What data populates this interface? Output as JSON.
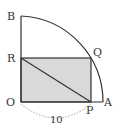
{
  "diagram": {
    "type": "geometry-quarter-circle-inscribed-rectangle",
    "colors": {
      "stroke": "#333333",
      "fill": "#d9d9d9",
      "dashed": "#999999"
    },
    "points": {
      "O": {
        "label": "O",
        "x": 21,
        "y": 102
      },
      "A": {
        "label": "A",
        "x": 103,
        "y": 102
      },
      "B": {
        "label": "B",
        "x": 21,
        "y": 16
      },
      "P": {
        "label": "P",
        "x": 91,
        "y": 102
      },
      "Q": {
        "label": "Q",
        "x": 91,
        "y": 58
      },
      "R": {
        "label": "R",
        "x": 21,
        "y": 58
      }
    },
    "measurement": {
      "label": "10",
      "between": "O-P"
    }
  }
}
